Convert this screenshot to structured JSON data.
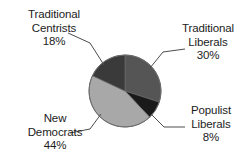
{
  "chart_data": {
    "type": "pie",
    "title": "",
    "subtitle": "",
    "xlabel": "",
    "ylabel": "",
    "legend_position": "callout-labels",
    "grid": false,
    "value_unit": "%",
    "start_angle_deg": 0,
    "direction": "clockwise",
    "categories": [
      "Traditional Liberals",
      "Populist Liberals",
      "New Democrats",
      "Traditional Centrists"
    ],
    "values": [
      30,
      8,
      44,
      18
    ],
    "colors": [
      "#555555",
      "#1a1a1a",
      "#a8a8a8",
      "#3a3a3a"
    ],
    "slices": [
      {
        "name": "Traditional Liberals",
        "label_line1": "Traditional",
        "label_line2": "Liberals",
        "value": 30,
        "value_text": "30%",
        "color": "#555555",
        "start_deg": 0,
        "end_deg": 108
      },
      {
        "name": "Populist Liberals",
        "label_line1": "Populist",
        "label_line2": "Liberals",
        "value": 8,
        "value_text": "8%",
        "color": "#1a1a1a",
        "start_deg": 108,
        "end_deg": 136.8
      },
      {
        "name": "New Democrats",
        "label_line1": "New",
        "label_line2": "Democrats",
        "value": 44,
        "value_text": "44%",
        "color": "#a8a8a8",
        "start_deg": 136.8,
        "end_deg": 295.2
      },
      {
        "name": "Traditional Centrists",
        "label_line1": "Traditional",
        "label_line2": "Centrists",
        "value": 18,
        "value_text": "18%",
        "color": "#3a3a3a",
        "start_deg": 295.2,
        "end_deg": 360
      }
    ]
  },
  "geometry": {
    "center_x": 125,
    "center_y": 91,
    "radius": 36,
    "outline_color": "#6a6a6a",
    "leader_color": "#4d4d4d"
  },
  "background_color": "#ffffff",
  "text_color": "#1c1c1c"
}
